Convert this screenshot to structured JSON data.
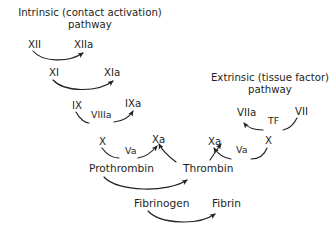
{
  "diagram": {
    "name": "coagulation-cascade",
    "background_color": "#ffffff",
    "text_color": "#231f20",
    "arrow_color": "#231f20",
    "titles": [
      {
        "id": "intrinsic-pathway-title",
        "line1": "Intrinsic (contact activation)",
        "line2": "pathway",
        "x": 11,
        "y": 7,
        "width": 158
      },
      {
        "id": "extrinsic-pathway-title",
        "line1": "Extrinsic (tissue factor)",
        "line2": "pathway",
        "x": 206,
        "y": 72,
        "width": 128
      }
    ],
    "nodes": [
      {
        "id": "factor-xii",
        "label": "XII",
        "x": 28,
        "y": 40,
        "kind": "factor"
      },
      {
        "id": "factor-xiia",
        "label": "XIIa",
        "x": 74,
        "y": 40,
        "kind": "factor"
      },
      {
        "id": "factor-xi",
        "label": "XI",
        "x": 49,
        "y": 68,
        "kind": "factor"
      },
      {
        "id": "factor-xia",
        "label": "XIa",
        "x": 104,
        "y": 68,
        "kind": "factor"
      },
      {
        "id": "factor-ix",
        "label": "IX",
        "x": 72,
        "y": 101,
        "kind": "factor"
      },
      {
        "id": "cofactor-viiia",
        "label": "VIIIa",
        "x": 90,
        "y": 110,
        "kind": "cofactor"
      },
      {
        "id": "factor-ixa",
        "label": "IXa",
        "x": 125,
        "y": 99,
        "kind": "factor"
      },
      {
        "id": "factor-x-intrinsic",
        "label": "X",
        "x": 99,
        "y": 137,
        "kind": "factor"
      },
      {
        "id": "cofactor-va-intrinsic",
        "label": "Va",
        "x": 124,
        "y": 146,
        "kind": "cofactor"
      },
      {
        "id": "factor-xa-intrinsic",
        "label": "Xa",
        "x": 152,
        "y": 135,
        "kind": "factor"
      },
      {
        "id": "factor-viia",
        "label": "VIIa",
        "x": 237,
        "y": 108,
        "kind": "factor"
      },
      {
        "id": "tissue-factor",
        "label": "TF",
        "x": 267,
        "y": 116,
        "kind": "cofactor"
      },
      {
        "id": "factor-vii",
        "label": "VII",
        "x": 295,
        "y": 107,
        "kind": "factor"
      },
      {
        "id": "factor-xa-extrinsic",
        "label": "Xa",
        "x": 208,
        "y": 137,
        "kind": "factor"
      },
      {
        "id": "cofactor-va-extrinsic",
        "label": "Va",
        "x": 235,
        "y": 145,
        "kind": "cofactor"
      },
      {
        "id": "factor-x-extrinsic",
        "label": "X",
        "x": 265,
        "y": 136,
        "kind": "factor"
      },
      {
        "id": "prothrombin",
        "label": "Prothrombin",
        "x": 88,
        "y": 163,
        "kind": "protein"
      },
      {
        "id": "thrombin",
        "label": "Thrombin",
        "x": 182,
        "y": 163,
        "kind": "protein"
      },
      {
        "id": "fibrinogen",
        "label": "Fibrinogen",
        "x": 133,
        "y": 198,
        "kind": "protein"
      },
      {
        "id": "fibrin",
        "label": "Fibrin",
        "x": 211,
        "y": 198,
        "kind": "protein"
      }
    ],
    "arrows": [
      {
        "id": "arrow-xii-to-xiia",
        "from": "factor-xii",
        "to": "factor-xiia"
      },
      {
        "id": "arrow-xi-to-xia",
        "from": "factor-xi",
        "to": "factor-xia"
      },
      {
        "id": "arrow-ix-to-ixa",
        "from": "factor-ix",
        "to": "factor-ixa"
      },
      {
        "id": "arrow-x-to-xa-intrinsic",
        "from": "factor-x-intrinsic",
        "to": "factor-xa-intrinsic"
      },
      {
        "id": "arrow-vii-to-viia",
        "from": "factor-vii",
        "to": "factor-viia"
      },
      {
        "id": "arrow-x-to-xa-extrinsic",
        "from": "factor-x-extrinsic",
        "to": "factor-xa-extrinsic"
      },
      {
        "id": "arrow-prothrombin-to-thrombin",
        "from": "prothrombin",
        "to": "thrombin"
      },
      {
        "id": "arrow-thrombin-to-xa-intrinsic",
        "from": "thrombin",
        "to": "factor-xa-intrinsic"
      },
      {
        "id": "arrow-thrombin-to-xa-extrinsic",
        "from": "thrombin",
        "to": "factor-xa-extrinsic"
      },
      {
        "id": "arrow-fibrinogen-to-fibrin",
        "from": "fibrinogen",
        "to": "fibrin"
      }
    ]
  }
}
